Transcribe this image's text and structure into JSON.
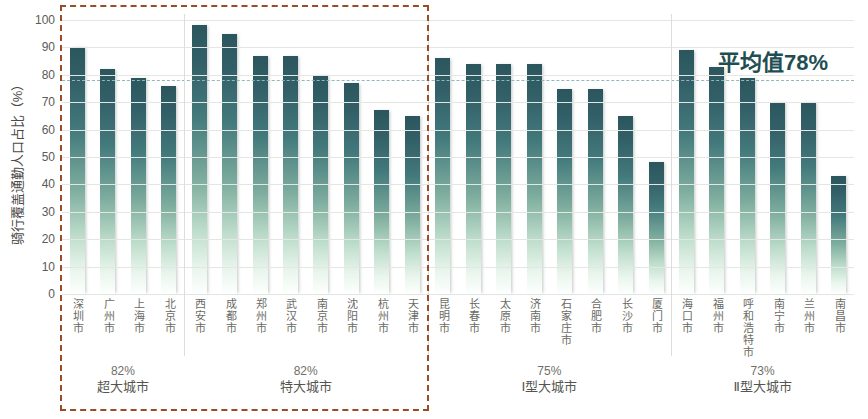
{
  "chart_data": {
    "type": "bar",
    "title": "",
    "xlabel": "",
    "ylabel": "骑行覆盖通勤人口占比（%）",
    "ylim": [
      0,
      100
    ],
    "yticks": [
      0,
      10,
      20,
      30,
      40,
      50,
      60,
      70,
      80,
      90,
      100
    ],
    "grid": true,
    "legend": "none",
    "categories": [
      "深圳市",
      "广州市",
      "上海市",
      "北京市",
      "西安市",
      "成都市",
      "郑州市",
      "武汉市",
      "南京市",
      "沈阳市",
      "杭州市",
      "天津市",
      "昆明市",
      "长春市",
      "太原市",
      "济南市",
      "石家庄市",
      "合肥市",
      "长沙市",
      "厦门市",
      "海口市",
      "福州市",
      "呼和浩特市",
      "南宁市",
      "兰州市",
      "南昌市"
    ],
    "values": [
      90,
      82,
      79,
      76,
      98,
      95,
      87,
      87,
      80,
      77,
      67,
      65,
      86,
      84,
      84,
      84,
      75,
      75,
      65,
      48,
      89,
      83,
      79,
      70,
      70,
      43
    ],
    "bar_color_top": "#2b565e",
    "bar_color_bottom": "#fdfffe",
    "annotations": [
      {
        "name": "average-line",
        "label": "平均值78%",
        "value": 78,
        "color": "#1f4e52",
        "line_color": "#8fb8bd",
        "style": "dashed"
      }
    ],
    "groups": [
      {
        "name": "超大城市",
        "percent": "82%",
        "count": 4,
        "start": 0
      },
      {
        "name": "特大城市",
        "percent": "82%",
        "count": 8,
        "start": 4
      },
      {
        "name": "Ⅰ型大城市",
        "percent": "75%",
        "count": 8,
        "start": 12
      },
      {
        "name": "Ⅱ型大城市",
        "percent": "73%",
        "count": 6,
        "start": 20
      }
    ],
    "highlight_region": {
      "name": "highlight-box",
      "color": "#9d4a27",
      "style": "dashed",
      "covers_groups": [
        "超大城市",
        "特大城市"
      ]
    }
  }
}
